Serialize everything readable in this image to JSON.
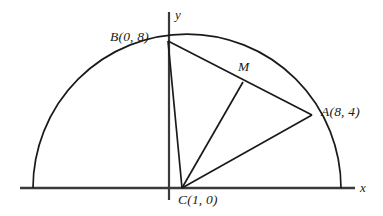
{
  "figure": {
    "type": "geometry-diagram",
    "background_color": "#ffffff",
    "stroke_color": "#1a1a1a"
  },
  "axes": {
    "x_label": "x",
    "y_label": "y",
    "x_axis": {
      "x1": 20,
      "y1": 188,
      "x2": 355,
      "y2": 188
    },
    "y_axis": {
      "x1": 169,
      "y1": 12,
      "x2": 169,
      "y2": 200
    }
  },
  "labels": {
    "b": "B(0, 8)",
    "a": "A(8, 4)",
    "c": "C(1, 0)",
    "m": "M",
    "x": "x",
    "y": "y"
  },
  "points": {
    "B": {
      "name": "B",
      "label": "B(0, 8)",
      "px": 168,
      "py": 41,
      "coord_x": 0,
      "coord_y": 8
    },
    "A": {
      "name": "A",
      "label": "A(8, 4)",
      "px": 312,
      "py": 115,
      "coord_x": 8,
      "coord_y": 4
    },
    "C": {
      "name": "C",
      "label": "C(1, 0)",
      "px": 182,
      "py": 188,
      "coord_x": 1,
      "coord_y": 0
    },
    "M": {
      "name": "M",
      "label": "M",
      "px": 243,
      "py": 82
    }
  },
  "arc": {
    "center_px": {
      "x": 187,
      "y": 188
    },
    "radius_px": 154,
    "start_px": {
      "x": 33,
      "y": 188
    },
    "end_px": {
      "x": 341,
      "y": 188
    },
    "path": "M 33 188 A 154 154 0 0 1 341 188"
  },
  "segments": [
    {
      "name": "B-A",
      "from": "B",
      "to": "A",
      "x1": 168,
      "y1": 41,
      "x2": 312,
      "y2": 115
    },
    {
      "name": "B-C",
      "from": "B",
      "to": "C",
      "x1": 168,
      "y1": 41,
      "x2": 182,
      "y2": 188
    },
    {
      "name": "C-A",
      "from": "C",
      "to": "A",
      "x1": 182,
      "y1": 188,
      "x2": 312,
      "y2": 115
    },
    {
      "name": "C-M",
      "from": "C",
      "to": "M",
      "x1": 182,
      "y1": 188,
      "x2": 243,
      "y2": 82
    }
  ]
}
